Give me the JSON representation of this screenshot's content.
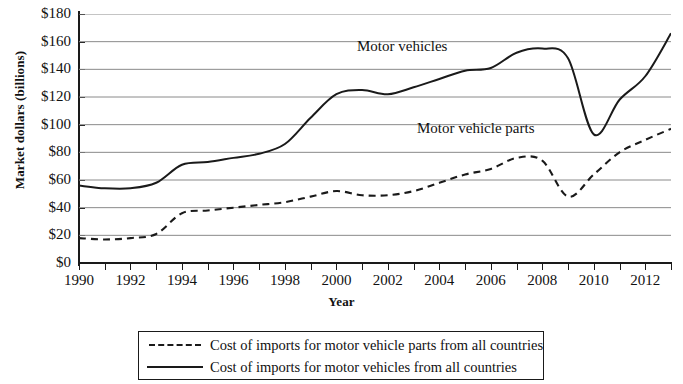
{
  "chart_data": {
    "type": "line",
    "title": "",
    "xlabel": "Year",
    "ylabel": "Market dollars (billions)",
    "xlim": [
      1990,
      2013
    ],
    "ylim": [
      0,
      180
    ],
    "grid": true,
    "legend_position": "bottom",
    "y_ticks": [
      "$0",
      "$20",
      "$40",
      "$60",
      "$80",
      "$100",
      "$120",
      "$140",
      "$160",
      "$180"
    ],
    "y_tick_values": [
      0,
      20,
      40,
      60,
      80,
      100,
      120,
      140,
      160,
      180
    ],
    "x_ticks": [
      "1990",
      "1992",
      "1994",
      "1996",
      "1998",
      "2000",
      "2002",
      "2004",
      "2006",
      "2008",
      "2010",
      "2012"
    ],
    "x_tick_values": [
      1990,
      1992,
      1994,
      1996,
      1998,
      2000,
      2002,
      2004,
      2006,
      2008,
      2010,
      2012
    ],
    "x": [
      1990,
      1991,
      1992,
      1993,
      1994,
      1995,
      1996,
      1997,
      1998,
      1999,
      2000,
      2001,
      2002,
      2003,
      2004,
      2005,
      2006,
      2007,
      2008,
      2009,
      2010,
      2011,
      2012,
      2013
    ],
    "series": [
      {
        "name": "Cost of imports for motor vehicles from all countries",
        "style": "solid",
        "color": "#1a1a1a",
        "annotation": "Motor vehicles",
        "values": [
          56,
          54,
          54,
          58,
          71,
          73,
          76,
          79,
          86,
          105,
          122,
          125,
          122,
          127,
          133,
          139,
          141,
          152,
          155,
          148,
          93,
          118,
          135,
          166
        ]
      },
      {
        "name": "Cost of imports for motor vehicle parts from all countries",
        "style": "dashed",
        "color": "#1a1a1a",
        "annotation": "Motor vehicle parts",
        "values": [
          18,
          17,
          18,
          21,
          36,
          38,
          40,
          42,
          44,
          48,
          52,
          49,
          49,
          52,
          58,
          64,
          68,
          76,
          74,
          48,
          64,
          80,
          89,
          97
        ]
      }
    ],
    "annotations": [
      {
        "text": "Motor vehicles",
        "x": 2005,
        "y": 170
      },
      {
        "text": "Motor vehicle parts",
        "x": 2007,
        "y": 108
      }
    ]
  },
  "axes": {
    "y_title": "Market dollars (billions)",
    "x_title": "Year"
  },
  "legend": {
    "items": [
      {
        "label": "Cost of imports for motor vehicle parts from all countries",
        "style": "dashed"
      },
      {
        "label": "Cost of imports for motor vehicles from all countries",
        "style": "solid"
      }
    ]
  }
}
